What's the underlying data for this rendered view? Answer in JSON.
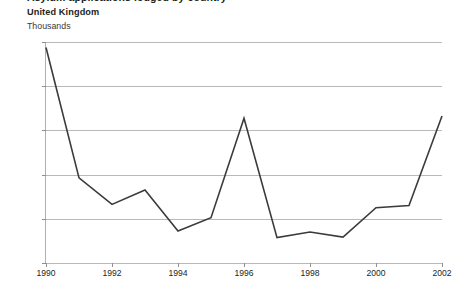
{
  "header": {
    "title_clipped": "Asylum applications lodged by country",
    "region": "United Kingdom",
    "units": "Thousands"
  },
  "chart_data": {
    "type": "line",
    "title": "Asylum applications lodged by country",
    "subtitle": "United Kingdom",
    "xlabel": "",
    "ylabel": "Thousands",
    "x": [
      1990,
      1991,
      1992,
      1993,
      1994,
      1995,
      1996,
      1997,
      1998,
      1999,
      2000,
      2001,
      2002
    ],
    "values": [
      1950,
      770,
      530,
      660,
      290,
      410,
      1310,
      230,
      280,
      235,
      500,
      520,
      1330
    ],
    "series": [
      {
        "name": "United Kingdom",
        "values": [
          1950,
          770,
          530,
          660,
          290,
          410,
          1310,
          230,
          280,
          235,
          500,
          520,
          1330
        ]
      }
    ],
    "xlim": [
      1990,
      2002
    ],
    "ylim": [
      0,
      2000
    ],
    "ytick_values": [
      0,
      400,
      800,
      1200,
      1600,
      2000
    ],
    "ytick_labels": [
      "0",
      "400",
      "800",
      "1,200",
      "1,600",
      "2,000"
    ],
    "xtick_values": [
      1990,
      1992,
      1994,
      1996,
      1998,
      2000,
      2002
    ],
    "xtick_labels": [
      "1990",
      "1992",
      "1994",
      "1996",
      "1998",
      "2000",
      "2002"
    ],
    "grid": "horizontal",
    "legend": "none",
    "line_color": "#3b3b3b",
    "grid_color": "#b9b9b9",
    "background": "#ffffff"
  }
}
